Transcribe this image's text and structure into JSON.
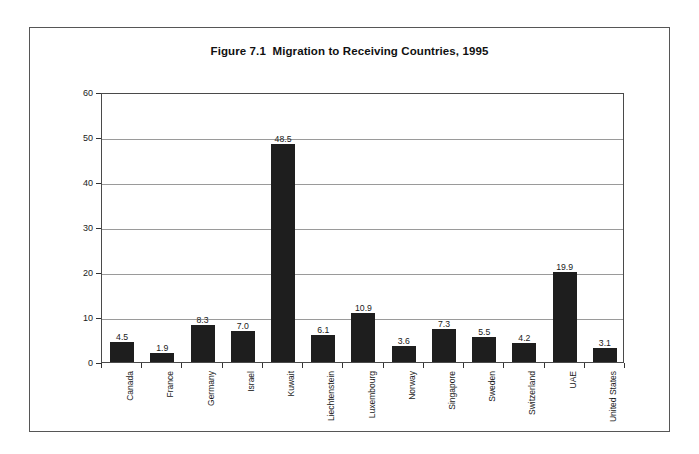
{
  "figure": {
    "title": "Figure 7.1  Migration to Receiving Countries, 1995"
  },
  "chart_data": {
    "type": "bar",
    "title": "Figure 7.1  Migration to Receiving Countries, 1995",
    "xlabel": "",
    "ylabel": "Migration Rate",
    "ylim": [
      0,
      60
    ],
    "ytick_labels": [
      "60",
      "50",
      "40",
      "30",
      "20",
      "10",
      "0"
    ],
    "yticks": [
      60,
      50,
      40,
      30,
      20,
      10,
      0
    ],
    "grid": true,
    "legend": null,
    "bar_color": "#1e1e1e",
    "categories": [
      "Canada",
      "France",
      "Germany",
      "Israel",
      "Kuwait",
      "Liechtenstein",
      "Luxembourg",
      "Norway",
      "Singapore",
      "Sweden",
      "Switzerland",
      "UAE",
      "United States"
    ],
    "values": [
      4.5,
      1.9,
      8.3,
      7.0,
      48.5,
      6.1,
      10.9,
      3.6,
      7.3,
      5.5,
      4.2,
      19.9,
      3.1
    ],
    "data_labels": [
      "4.5",
      "1.9",
      "8.3",
      "7.0",
      "48.5",
      "6.1",
      "10.9",
      "3.6",
      "7.3",
      "5.5",
      "4.2",
      "19.9",
      "3.1"
    ]
  }
}
